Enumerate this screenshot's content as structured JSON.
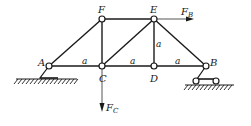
{
  "diagram": {
    "type": "truss",
    "nodes": {
      "A": {
        "label": "A",
        "x": 49,
        "y": 66
      },
      "C": {
        "label": "C",
        "x": 102,
        "y": 66
      },
      "D": {
        "label": "D",
        "x": 154,
        "y": 66
      },
      "B": {
        "label": "B",
        "x": 206,
        "y": 66
      },
      "F": {
        "label": "F",
        "x": 102,
        "y": 19
      },
      "E": {
        "label": "E",
        "x": 154,
        "y": 19
      }
    },
    "members": [
      [
        "A",
        "F"
      ],
      [
        "A",
        "C"
      ],
      [
        "F",
        "C"
      ],
      [
        "F",
        "E"
      ],
      [
        "C",
        "E"
      ],
      [
        "C",
        "D"
      ],
      [
        "E",
        "D"
      ],
      [
        "E",
        "B"
      ],
      [
        "D",
        "B"
      ]
    ],
    "dimension_labels": [
      {
        "text": "a",
        "between": "A-C"
      },
      {
        "text": "a",
        "between": "C-D"
      },
      {
        "text": "a",
        "between": "D-B"
      },
      {
        "text": "a",
        "between": "E-D"
      }
    ],
    "supports": [
      {
        "node": "A",
        "type": "pinned"
      },
      {
        "node": "B",
        "type": "roller"
      }
    ],
    "loads": [
      {
        "node": "E",
        "label": "F",
        "subscript": "B",
        "direction": "right"
      },
      {
        "node": "C",
        "label": "F",
        "subscript": "C",
        "direction": "down"
      }
    ],
    "colors": {
      "line": "#1a1a1a",
      "load": "#1a1a1a",
      "background": "#ffffff"
    }
  }
}
